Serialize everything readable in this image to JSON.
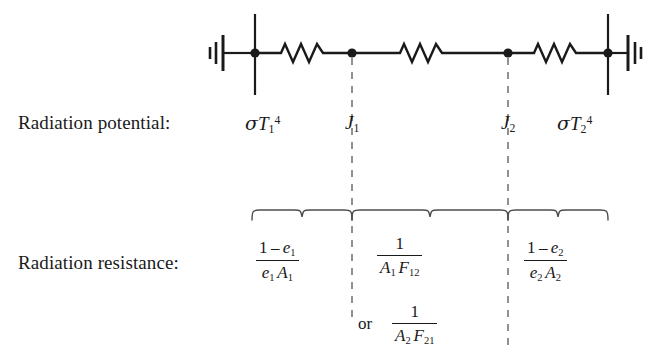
{
  "figure": {
    "type": "thermal-radiation-network-diagram"
  },
  "rows": {
    "potential_label": "Radiation potential:",
    "resistance_label": "Radiation resistance:"
  },
  "potentials": [
    {
      "id": "surface1",
      "text": "σT₁⁴",
      "sigma": "σ",
      "base": "T",
      "sub": "1",
      "sup": "4"
    },
    {
      "id": "j1",
      "text": "J₁",
      "base": "J",
      "sub": "1",
      "sup": ""
    },
    {
      "id": "j2",
      "text": "J₂",
      "base": "J",
      "sub": "2",
      "sup": ""
    },
    {
      "id": "surface2",
      "text": "σT₂⁴",
      "sigma": "σ",
      "base": "T",
      "sub": "2",
      "sup": "4"
    }
  ],
  "resistances": [
    {
      "id": "surface-resistance-1",
      "numerator": "1 − e₁",
      "denominator": "e₁ A₁",
      "num_parts": {
        "one": "1",
        "minus": "–",
        "sym": "e",
        "sub": "1"
      },
      "den_parts": {
        "sym1": "e",
        "sub1": "1",
        "sym2": "A",
        "sub2": "1"
      }
    },
    {
      "id": "space-resistance",
      "numerator": "1",
      "denominator": "A₁ F₁₂",
      "num_parts": {
        "one": "1"
      },
      "den_parts": {
        "sym1": "A",
        "sub1": "1",
        "sym2": "F",
        "sub2": "12"
      }
    },
    {
      "id": "space-resistance-alt",
      "prefix": "or",
      "numerator": "1",
      "denominator": "A₂ F₂₁",
      "num_parts": {
        "one": "1"
      },
      "den_parts": {
        "sym1": "A",
        "sub1": "2",
        "sym2": "F",
        "sub2": "21"
      }
    },
    {
      "id": "surface-resistance-2",
      "numerator": "1 − e₂",
      "denominator": "e₂ A₂",
      "num_parts": {
        "one": "1",
        "minus": "–",
        "sym": "e",
        "sub": "2"
      },
      "den_parts": {
        "sym1": "e",
        "sub1": "2",
        "sym2": "A",
        "sub2": "2"
      }
    }
  ],
  "circuit": {
    "nodes": [
      {
        "id": "node-left",
        "x": 255,
        "y": 53,
        "label": "σT₁⁴"
      },
      {
        "id": "node-j1",
        "x": 352,
        "y": 53,
        "label": "J₁"
      },
      {
        "id": "node-j2",
        "x": 508,
        "y": 53,
        "label": "J₂"
      },
      {
        "id": "node-right",
        "x": 608,
        "y": 53,
        "label": "σT₂⁴"
      }
    ],
    "resistors": [
      {
        "id": "resistor-1",
        "from": "node-left",
        "to": "node-j1"
      },
      {
        "id": "resistor-2",
        "from": "node-j1",
        "to": "node-j2"
      },
      {
        "id": "resistor-3",
        "from": "node-j2",
        "to": "node-right"
      }
    ],
    "grounds": [
      {
        "id": "ground-left",
        "x": 220,
        "y": 53
      },
      {
        "id": "ground-right",
        "x": 643,
        "y": 53
      }
    ]
  },
  "colors": {
    "ink": "#1a1a1a",
    "background": "#ffffff",
    "dashed": "#6e6e6e",
    "brace": "#4d4d4d"
  }
}
